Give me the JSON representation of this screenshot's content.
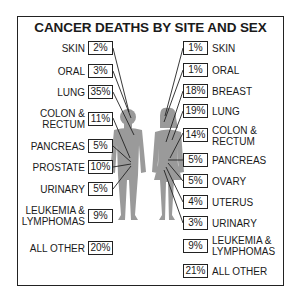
{
  "title": "CANCER DEATHS BY SITE AND SEX",
  "male": [
    {
      "site": "SKIN",
      "pct": "2%"
    },
    {
      "site": "ORAL",
      "pct": "3%"
    },
    {
      "site": "LUNG",
      "pct": "35%"
    },
    {
      "site": "COLON &",
      "site2": "RECTUM",
      "pct": "11%"
    },
    {
      "site": "PANCREAS",
      "pct": "5%"
    },
    {
      "site": "PROSTATE",
      "pct": "10%"
    },
    {
      "site": "URINARY",
      "pct": "5%"
    },
    {
      "site": "LEUKEMIA &",
      "site2": "LYMPHOMAS",
      "pct": "9%"
    },
    {
      "site": "ALL OTHER",
      "pct": "20%"
    }
  ],
  "female": [
    {
      "site": "SKIN",
      "pct": "1%"
    },
    {
      "site": "ORAL",
      "pct": "1%"
    },
    {
      "site": "BREAST",
      "pct": "18%"
    },
    {
      "site": "LUNG",
      "pct": "19%"
    },
    {
      "site": "COLON &",
      "site2": "RECTUM",
      "pct": "14%"
    },
    {
      "site": "PANCREAS",
      "pct": "5%"
    },
    {
      "site": "OVARY",
      "pct": "5%"
    },
    {
      "site": "UTERUS",
      "pct": "4%"
    },
    {
      "site": "URINARY",
      "pct": "3%"
    },
    {
      "site": "LEUKEMIA &",
      "site2": "LYMPHOMAS",
      "pct": "9%"
    },
    {
      "site": "ALL OTHER",
      "pct": "21%"
    }
  ],
  "colors": {
    "figure": "#9a9a9a",
    "line": "#222222",
    "border": "#222222"
  }
}
